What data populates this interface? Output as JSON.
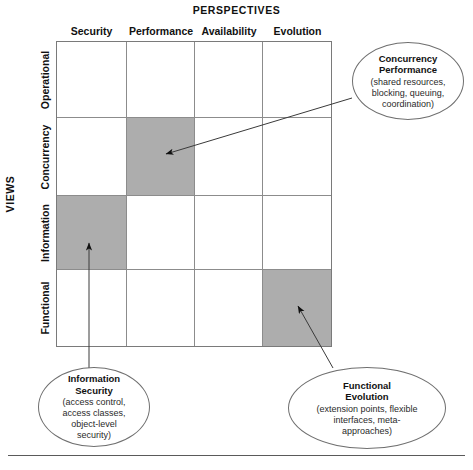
{
  "diagram": {
    "axis_titles": {
      "columns": "PERSPECTIVES",
      "rows": "VIEWS"
    },
    "columns": [
      {
        "label": "Security"
      },
      {
        "label": "Performance"
      },
      {
        "label": "Availability"
      },
      {
        "label": "Evolution"
      }
    ],
    "rows": [
      {
        "label": "Operational"
      },
      {
        "label": "Concurrency"
      },
      {
        "label": "Information"
      },
      {
        "label": "Functional"
      }
    ],
    "shaded_cells": [
      {
        "row": "Concurrency",
        "column": "Performance"
      },
      {
        "row": "Information",
        "column": "Security"
      },
      {
        "row": "Functional",
        "column": "Evolution"
      }
    ],
    "colors": {
      "shaded_cell": "#adadad",
      "grid_line": "#8c8c8c",
      "grid_border": "#7a7a7a",
      "text": "#111111"
    },
    "callouts": [
      {
        "id": "concurrency-performance",
        "title": "Concurrency\nPerformance",
        "detail": "(shared resources,\nblocking, queuing,\ncoordination)",
        "points_to_row": "Concurrency",
        "points_to_column": "Performance"
      },
      {
        "id": "information-security",
        "title": "Information\nSecurity",
        "detail": "(access control,\naccess classes,\nobject-level\nsecurity)",
        "points_to_row": "Information",
        "points_to_column": "Security"
      },
      {
        "id": "functional-evolution",
        "title": "Functional\nEvolution",
        "detail": "(extension points, flexible\ninterfaces, meta-\napproaches)",
        "points_to_row": "Functional",
        "points_to_column": "Evolution"
      }
    ]
  }
}
